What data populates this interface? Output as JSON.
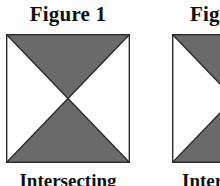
{
  "page": {
    "background_color": "#fdfdfd",
    "width": 220,
    "height": 186
  },
  "style": {
    "fill_gray": "#6a6a6a",
    "stroke_color": "#2b2b2b",
    "white": "#ffffff",
    "text_color": "#111111"
  },
  "figures": [
    {
      "title": "Figure 1",
      "caption": "Intersecting",
      "diagram": {
        "shape": "square-with-x-diagonals",
        "shaded_regions": [
          "top",
          "bottom"
        ],
        "unshaded_regions": [
          "left",
          "right"
        ]
      }
    },
    {
      "title": "Figure 2",
      "caption": "Intersecting",
      "diagram": {
        "shape": "square-with-x-diagonals",
        "shaded_regions": [
          "top-right",
          "bottom-right"
        ],
        "unshaded_regions": [
          "left"
        ]
      }
    }
  ]
}
